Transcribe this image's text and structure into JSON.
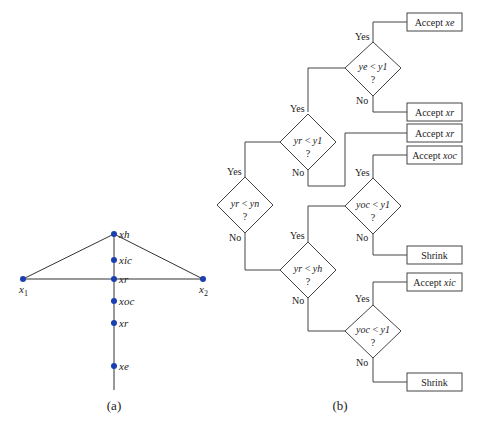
{
  "panel_a": {
    "caption": "(a)",
    "points": [
      {
        "id": "xh",
        "label": "xh",
        "x": 114,
        "y": 234
      },
      {
        "id": "xic",
        "label": "xic",
        "x": 114,
        "y": 260
      },
      {
        "id": "xr_top",
        "label": "xr",
        "x": 114,
        "y": 279
      },
      {
        "id": "xoc",
        "label": "xoc",
        "x": 114,
        "y": 301
      },
      {
        "id": "xr_bottom",
        "label": "xr",
        "x": 114,
        "y": 323
      },
      {
        "id": "xe",
        "label": "xe",
        "x": 114,
        "y": 366
      }
    ],
    "x1": {
      "label": "x",
      "sub": "1",
      "x": 23,
      "y": 279
    },
    "x2": {
      "label": "x",
      "sub": "2",
      "x": 203,
      "y": 279
    },
    "point_color": "#1a3fb0"
  },
  "panel_b": {
    "caption": "(b)",
    "yes": "Yes",
    "no": "No",
    "q": "?",
    "decisions": {
      "d1": {
        "lhs": "ye",
        "op": " < ",
        "rhs": "y1"
      },
      "d2": {
        "lhs": "yr",
        "op": " < ",
        "rhs": "y1"
      },
      "d3": {
        "lhs": "yr",
        "op": " < ",
        "rhs": "yn"
      },
      "d4": {
        "lhs": "yoc",
        "op": " < ",
        "rhs": "y1"
      },
      "d5": {
        "lhs": "yr",
        "op": " < ",
        "rhs": "yh"
      },
      "d6": {
        "lhs": "yoc",
        "op": " < ",
        "rhs": "y1"
      }
    },
    "outcomes": {
      "o1": {
        "word": "Accept ",
        "var": "xe"
      },
      "o2": {
        "word": "Accept ",
        "var": "xr"
      },
      "o3": {
        "word": "Accept ",
        "var": "xr"
      },
      "o4": {
        "word": "Accept ",
        "var": "xoc"
      },
      "o5": {
        "word": "Shrink",
        "var": ""
      },
      "o6": {
        "word": "Accept ",
        "var": "xic"
      },
      "o7": {
        "word": "Shrink",
        "var": ""
      }
    }
  }
}
